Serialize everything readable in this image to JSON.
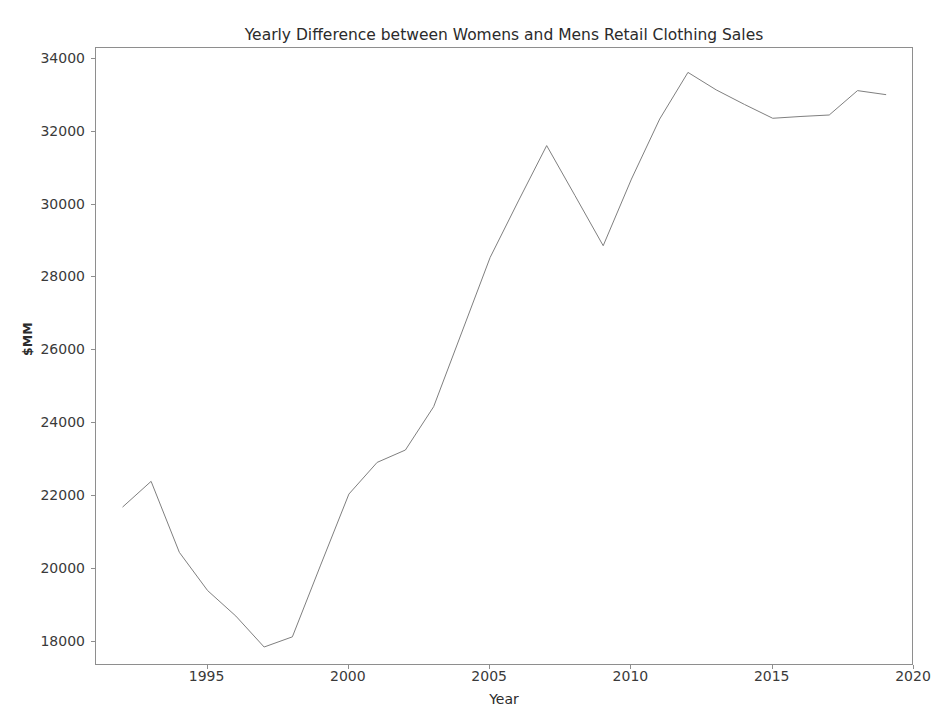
{
  "chart_data": {
    "type": "line",
    "title": "Yearly Difference between Womens and Mens Retail Clothing Sales",
    "xlabel": "Year",
    "ylabel": "$MM",
    "x": [
      1992,
      1993,
      1994,
      1995,
      1996,
      1997,
      1998,
      1999,
      2000,
      2001,
      2002,
      2003,
      2004,
      2005,
      2006,
      2007,
      2008,
      2009,
      2010,
      2011,
      2012,
      2013,
      2014,
      2015,
      2016,
      2017,
      2018,
      2019
    ],
    "values": [
      21700,
      22400,
      20450,
      19400,
      18700,
      17850,
      18130,
      20100,
      22050,
      22920,
      23260,
      24450,
      26500,
      28550,
      30100,
      31620,
      30250,
      28870,
      30700,
      32350,
      33630,
      33150,
      32750,
      32370,
      32420,
      32460,
      33130,
      33020
    ],
    "series": [
      {
        "name": "Difference",
        "values": [
          21700,
          22400,
          20450,
          19400,
          18700,
          17850,
          18130,
          20100,
          22050,
          22920,
          23260,
          24450,
          26500,
          28550,
          30100,
          31620,
          30250,
          28870,
          30700,
          32350,
          33630,
          33150,
          32750,
          32370,
          32420,
          32460,
          33130,
          33020
        ]
      }
    ],
    "xlim": [
      1991.05,
      2020.0
    ],
    "ylim": [
      17329,
      34300
    ],
    "xticks": [
      1995,
      2000,
      2005,
      2010,
      2015,
      2020
    ],
    "xtick_labels": [
      "1995",
      "2000",
      "2005",
      "2010",
      "2015",
      "2020"
    ],
    "yticks": [
      18000,
      20000,
      22000,
      24000,
      26000,
      28000,
      30000,
      32000,
      34000
    ],
    "ytick_labels": [
      "18000",
      "20000",
      "22000",
      "24000",
      "26000",
      "28000",
      "30000",
      "32000",
      "34000"
    ],
    "grid": false,
    "legend": null,
    "line_color": "#7f7f7f",
    "line_width": 1,
    "background_color": "#ffffff",
    "axis_color": "#8e8e8e"
  }
}
